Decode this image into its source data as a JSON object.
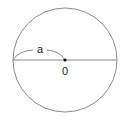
{
  "diagram": {
    "type": "circle-radius",
    "circle": {
      "cx": 65,
      "cy": 60,
      "r": 52,
      "stroke": "#8a8a8a"
    },
    "diameter": {
      "x1": 13,
      "x2": 117,
      "y": 60,
      "stroke": "#8a8a8a"
    },
    "center_point": {
      "x": 65,
      "y": 60,
      "label": "0"
    },
    "radius_label": {
      "text": "a",
      "from": "left-edge",
      "to": "center"
    }
  }
}
